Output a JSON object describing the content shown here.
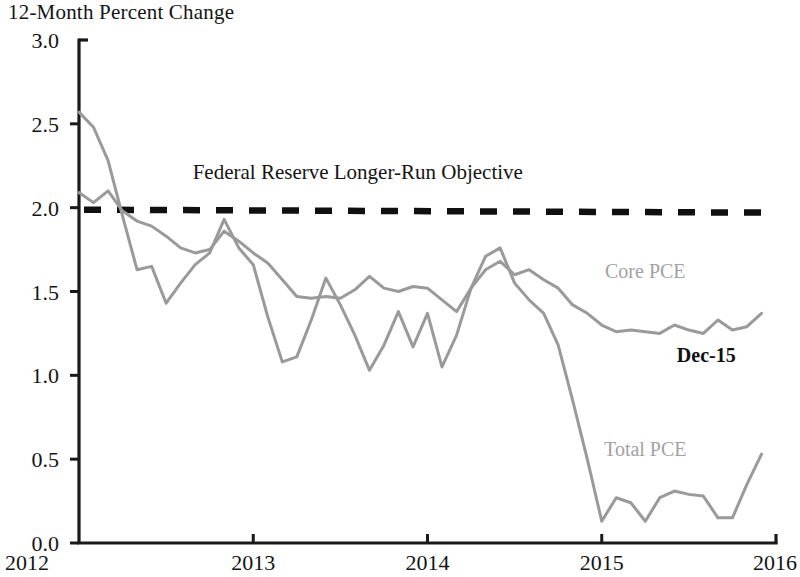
{
  "chart_data": {
    "type": "line",
    "title": "12-Month Percent Change",
    "xlabel": "",
    "ylabel": "",
    "ylim": [
      0.0,
      3.0
    ],
    "xlim": [
      2012.0,
      2016.0
    ],
    "ytick_labels": [
      "0.0",
      "0.5",
      "1.0",
      "1.5",
      "2.0",
      "2.5",
      "3.0"
    ],
    "ytick_values": [
      0.0,
      0.5,
      1.0,
      1.5,
      2.0,
      2.5,
      3.0
    ],
    "xtick_labels": [
      "2012",
      "2013",
      "2014",
      "2015",
      "2016"
    ],
    "xtick_values": [
      2012,
      2013,
      2014,
      2015,
      2016
    ],
    "grid": false,
    "legend_position": "inline-annotation",
    "series": [
      {
        "name": "Total PCE",
        "color": "#9a9a9a",
        "x": [
          2012.0,
          2012.083,
          2012.167,
          2012.25,
          2012.333,
          2012.417,
          2012.5,
          2012.583,
          2012.667,
          2012.75,
          2012.833,
          2012.917,
          2013.0,
          2013.083,
          2013.167,
          2013.25,
          2013.333,
          2013.417,
          2013.5,
          2013.583,
          2013.667,
          2013.75,
          2013.833,
          2013.917,
          2014.0,
          2014.083,
          2014.167,
          2014.25,
          2014.333,
          2014.417,
          2014.5,
          2014.583,
          2014.667,
          2014.75,
          2014.833,
          2014.917,
          2015.0,
          2015.083,
          2015.167,
          2015.25,
          2015.333,
          2015.417,
          2015.5,
          2015.583,
          2015.667,
          2015.75,
          2015.833,
          2015.917
        ],
        "values": [
          2.57,
          2.48,
          2.28,
          1.95,
          1.63,
          1.65,
          1.43,
          1.55,
          1.66,
          1.73,
          1.93,
          1.76,
          1.66,
          1.35,
          1.08,
          1.11,
          1.33,
          1.58,
          1.42,
          1.24,
          1.03,
          1.18,
          1.38,
          1.17,
          1.37,
          1.05,
          1.24,
          1.52,
          1.71,
          1.76,
          1.55,
          1.45,
          1.37,
          1.18,
          0.85,
          0.5,
          0.13,
          0.27,
          0.24,
          0.13,
          0.27,
          0.31,
          0.29,
          0.28,
          0.15,
          0.15,
          0.35,
          0.53
        ],
        "label_annotation": "Total PCE"
      },
      {
        "name": "Core PCE",
        "color": "#9a9a9a",
        "x": [
          2012.0,
          2012.083,
          2012.167,
          2012.25,
          2012.333,
          2012.417,
          2012.5,
          2012.583,
          2012.667,
          2012.75,
          2012.833,
          2012.917,
          2013.0,
          2013.083,
          2013.167,
          2013.25,
          2013.333,
          2013.417,
          2013.5,
          2013.583,
          2013.667,
          2013.75,
          2013.833,
          2013.917,
          2014.0,
          2014.083,
          2014.167,
          2014.25,
          2014.333,
          2014.417,
          2014.5,
          2014.583,
          2014.667,
          2014.75,
          2014.833,
          2014.917,
          2015.0,
          2015.083,
          2015.167,
          2015.25,
          2015.333,
          2015.417,
          2015.5,
          2015.583,
          2015.667,
          2015.75,
          2015.833,
          2015.917
        ],
        "values": [
          2.09,
          2.03,
          2.1,
          1.98,
          1.92,
          1.89,
          1.83,
          1.76,
          1.73,
          1.75,
          1.86,
          1.8,
          1.73,
          1.67,
          1.57,
          1.47,
          1.46,
          1.47,
          1.46,
          1.51,
          1.59,
          1.52,
          1.5,
          1.53,
          1.52,
          1.45,
          1.38,
          1.52,
          1.63,
          1.68,
          1.6,
          1.63,
          1.57,
          1.52,
          1.42,
          1.37,
          1.3,
          1.26,
          1.27,
          1.26,
          1.25,
          1.3,
          1.27,
          1.25,
          1.33,
          1.27,
          1.29,
          1.37
        ],
        "label_annotation": "Core PCE"
      }
    ],
    "reference_line": {
      "label": "Federal Reserve Longer-Run Objective",
      "value": 2.0,
      "style": "dashed",
      "color": "#101010"
    },
    "annotations": [
      {
        "text": "Federal Reserve Longer-Run Objective",
        "x": 2013.6,
        "y": 2.17,
        "color": "#141414",
        "bold": false
      },
      {
        "text": "Core PCE",
        "x": 2015.25,
        "y": 1.58,
        "color": "#a2a2a2",
        "bold": false
      },
      {
        "text": "Dec-15",
        "x": 2015.6,
        "y": 1.08,
        "color": "#101010",
        "bold": true
      },
      {
        "text": "Total PCE",
        "x": 2015.25,
        "y": 0.52,
        "color": "#a2a2a2",
        "bold": false
      }
    ]
  },
  "labels": {
    "title": "12-Month Percent Change",
    "objective": "Federal Reserve Longer-Run Objective",
    "core_pce": "Core PCE",
    "total_pce": "Total PCE",
    "dec15": "Dec-15",
    "y_0": "0.0",
    "y_1": "0.5",
    "y_2": "1.0",
    "y_3": "1.5",
    "y_4": "2.0",
    "y_5": "2.5",
    "y_6": "3.0",
    "x_0": "2012",
    "x_1": "2013",
    "x_2": "2014",
    "x_3": "2015",
    "x_4": "2016"
  }
}
